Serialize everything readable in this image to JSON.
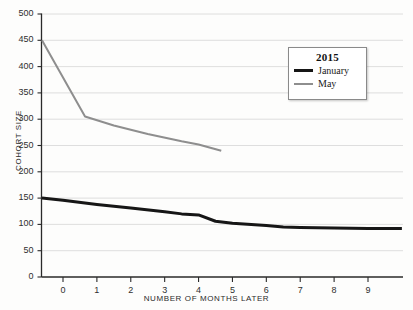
{
  "chart_data": {
    "type": "line",
    "title": "",
    "xlabel": "NUMBER OF MONTHS LATER",
    "ylabel": "COHORT SIZE",
    "xlim": [
      -0.62,
      10.0
    ],
    "ylim": [
      0,
      500
    ],
    "xticks": [
      0,
      1,
      2,
      3,
      4,
      5,
      6,
      7,
      8,
      9
    ],
    "xtick_labels": [
      "0",
      "1",
      "2",
      "3",
      "4",
      "5",
      "6",
      "7",
      "8",
      "9"
    ],
    "yticks": [
      0,
      50,
      100,
      150,
      200,
      250,
      300,
      350,
      400,
      450,
      500
    ],
    "ytick_labels": [
      "0",
      "50",
      "100",
      "150",
      "200",
      "250",
      "300",
      "350",
      "400",
      "450",
      "500"
    ],
    "grid": "horizontal",
    "legend_position": "upper-right",
    "legend_title": "2015",
    "series": [
      {
        "name": "January",
        "color": "#161616",
        "linewidth": 3,
        "x": [
          -0.62,
          0.0,
          1.0,
          2.0,
          3.0,
          3.5,
          4.0,
          4.5,
          5.0,
          6.0,
          6.5,
          7.0,
          8.0,
          9.0,
          9.5,
          10.0
        ],
        "y": [
          150,
          146,
          138,
          131,
          124,
          120,
          118,
          106,
          102,
          98,
          95,
          94,
          93,
          92,
          92,
          92
        ]
      },
      {
        "name": "May",
        "color": "#8e8e8e",
        "linewidth": 2,
        "x": [
          -0.62,
          0.65,
          1.5,
          2.5,
          3.5,
          4.0,
          4.67
        ],
        "y": [
          450,
          305,
          288,
          272,
          258,
          252,
          240
        ]
      }
    ]
  },
  "legend": {
    "title": "2015",
    "entries": [
      {
        "label": "January",
        "color": "#161616"
      },
      {
        "label": "May",
        "color": "#8e8e8e"
      }
    ]
  },
  "axes": {
    "y_axis_title": "COHORT SIZE",
    "x_axis_title": "NUMBER OF MONTHS LATER"
  }
}
